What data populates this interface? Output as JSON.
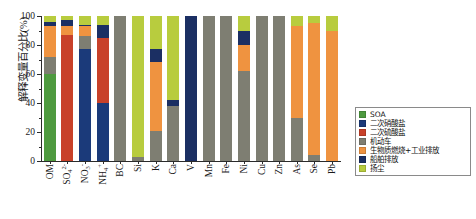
{
  "chart_data": {
    "type": "bar",
    "stacked": true,
    "stack_mode": "percent",
    "title": "",
    "subtitle": "",
    "xlabel": "",
    "ylabel": "解释变量百分比(%)",
    "ylim": [
      0,
      100
    ],
    "yticks": [
      0,
      20,
      40,
      60,
      80,
      100
    ],
    "ytick_labels": [
      "0",
      "20",
      "40",
      "60",
      "80",
      "100"
    ],
    "grid": false,
    "legend_position": "right",
    "categories": [
      "OM",
      "SO4",
      "NO3",
      "NH4",
      "BC",
      "Si",
      "K",
      "Ca",
      "V",
      "Mn",
      "Fe",
      "Ni",
      "Cu",
      "Zn",
      "As",
      "Se",
      "Pb"
    ],
    "category_labels_html": [
      {
        "base": "OM",
        "sub": "",
        "sup": ""
      },
      {
        "base": "SO",
        "sub": "4",
        "sup": "2-"
      },
      {
        "base": "NO",
        "sub": "3",
        "sup": "-"
      },
      {
        "base": "NH",
        "sub": "4",
        "sup": "+"
      },
      {
        "base": "BC",
        "sub": "",
        "sup": ""
      },
      {
        "base": "Si",
        "sub": "",
        "sup": ""
      },
      {
        "base": "K",
        "sub": "",
        "sup": ""
      },
      {
        "base": "Ca",
        "sub": "",
        "sup": ""
      },
      {
        "base": "V",
        "sub": "",
        "sup": ""
      },
      {
        "base": "Mn",
        "sub": "",
        "sup": ""
      },
      {
        "base": "Fe",
        "sub": "",
        "sup": ""
      },
      {
        "base": "Ni",
        "sub": "",
        "sup": ""
      },
      {
        "base": "Cu",
        "sub": "",
        "sup": ""
      },
      {
        "base": "Zn",
        "sub": "",
        "sup": ""
      },
      {
        "base": "As",
        "sub": "",
        "sup": ""
      },
      {
        "base": "Se",
        "sub": "",
        "sup": ""
      },
      {
        "base": "Pb",
        "sub": "",
        "sup": ""
      }
    ],
    "series": [
      {
        "name": "SOA",
        "color": "#4E9A3F",
        "values": [
          60,
          0,
          0,
          0,
          0,
          0,
          0,
          0,
          0,
          0,
          0,
          0,
          0,
          0,
          0,
          0,
          0
        ]
      },
      {
        "name": "二次硝酸盐",
        "color": "#1B3A7A",
        "values": [
          0,
          0,
          77,
          40,
          0,
          0,
          0,
          0,
          0,
          0,
          0,
          0,
          0,
          0,
          0,
          0,
          0
        ]
      },
      {
        "name": "二次硫酸盐",
        "color": "#C8412A",
        "values": [
          0,
          87,
          0,
          45,
          0,
          0,
          0,
          0,
          0,
          0,
          0,
          0,
          0,
          0,
          0,
          0,
          0
        ]
      },
      {
        "name": "机动车",
        "color": "#7E7E72",
        "values": [
          12,
          0,
          9,
          0,
          100,
          3,
          21,
          38,
          0,
          100,
          100,
          62,
          100,
          100,
          30,
          4,
          0
        ]
      },
      {
        "name": "生物质燃烧+工业排放",
        "color": "#EF9340",
        "values": [
          21,
          6,
          7,
          0,
          0,
          0,
          47,
          0,
          0,
          0,
          0,
          18,
          0,
          0,
          63,
          91,
          90
        ]
      },
      {
        "name": "船舶排放",
        "color": "#1B2F63",
        "values": [
          3,
          4,
          1,
          9,
          0,
          0,
          9,
          4,
          100,
          0,
          0,
          10,
          0,
          0,
          0,
          0,
          0
        ]
      },
      {
        "name": "扬尘",
        "color": "#B8CC3E",
        "values": [
          4,
          3,
          6,
          6,
          0,
          97,
          23,
          58,
          0,
          0,
          0,
          10,
          0,
          0,
          7,
          5,
          10
        ]
      }
    ],
    "legend_entries": [
      {
        "label": "SOA",
        "color": "#4E9A3F"
      },
      {
        "label": "二次硝酸盐",
        "color": "#1B3A7A"
      },
      {
        "label": "二次硫酸盐",
        "color": "#C8412A"
      },
      {
        "label": "机动车",
        "color": "#7E7E72"
      },
      {
        "label": "生物质燃烧+工业排放",
        "color": "#EF9340"
      },
      {
        "label": "船舶排放",
        "color": "#1B2F63"
      },
      {
        "label": "扬尘",
        "color": "#B8CC3E"
      }
    ]
  }
}
